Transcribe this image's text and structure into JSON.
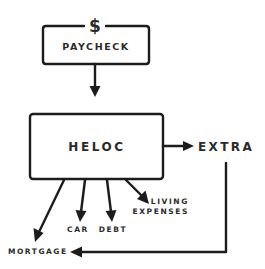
{
  "diagram": {
    "type": "flow",
    "nodes": {
      "dollar": "$",
      "paycheck": "PAYCHECK",
      "heloc": "HELOC",
      "extra": "EXTRA",
      "car": "CAR",
      "debt": "DEBT",
      "living_line1": "LIVING",
      "living_line2": "EXPENSES",
      "mortgage": "MORTGAGE"
    },
    "edges": [
      {
        "from": "PAYCHECK",
        "to": "HELOC"
      },
      {
        "from": "HELOC",
        "to": "EXTRA"
      },
      {
        "from": "HELOC",
        "to": "MORTGAGE"
      },
      {
        "from": "HELOC",
        "to": "CAR"
      },
      {
        "from": "HELOC",
        "to": "DEBT"
      },
      {
        "from": "HELOC",
        "to": "LIVING EXPENSES"
      },
      {
        "from": "EXTRA",
        "to": "MORTGAGE"
      }
    ],
    "colors": {
      "stroke": "#1c1c1c",
      "text": "#2b2b2b",
      "background": "#ffffff"
    }
  }
}
